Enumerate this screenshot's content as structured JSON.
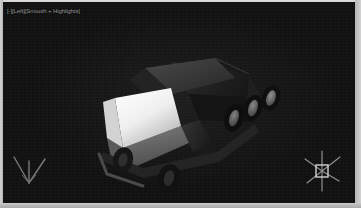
{
  "window": {
    "width": 361,
    "height": 208,
    "frame_color": "#bdbdbd",
    "viewport_bg": "#111111"
  },
  "viewport": {
    "label": "[-][Left][Smooth + Highlights]",
    "shading_mode": "Smooth + Highlights",
    "view_name": "Left",
    "label_color": "#9a9a9a"
  },
  "scene": {
    "object_name": "vehicle-model",
    "description": "Low-poly 3D truck / van model rendered in a dark viewport",
    "body_color": "#2a2a2a",
    "windshield_color": "#f2f2f2",
    "hood_color": "#b9b9b9",
    "roof_color": "#3d3d3d",
    "tire_color": "#1c1c1c",
    "rim_color": "#8c8c8c",
    "wheel_count": 5,
    "rear_axle_wheels": 3,
    "front_axle_wheels": 2
  },
  "gizmos": {
    "axis_tripod": {
      "name": "world-axis-tripod",
      "position": "bottom-left",
      "color": "#7d7d7d",
      "axes": [
        "x",
        "y",
        "z"
      ]
    },
    "light": {
      "name": "omni-light-gizmo",
      "position": "bottom-right",
      "color": "#9c9c9c",
      "ray_count": 6
    }
  }
}
